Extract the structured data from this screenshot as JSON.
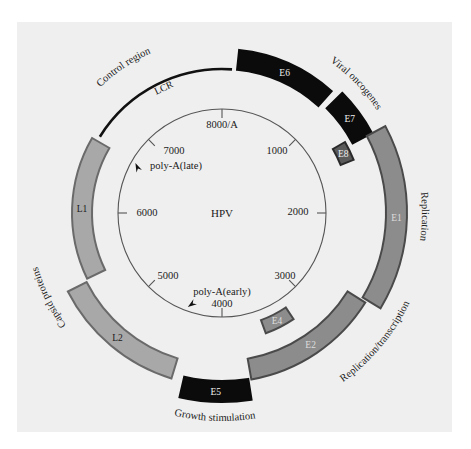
{
  "diagram": {
    "title": "HPV",
    "center": {
      "x": 222,
      "y": 213
    },
    "colors": {
      "background": "#ffffff",
      "panel": "#efefef",
      "black_gene": "#0b0b0b",
      "light_gene_fill": "#a8a8a8",
      "light_gene_edge": "#6a6a6a",
      "mid_gene_fill": "#8c8c8c",
      "mid_gene_edge": "#4a4a4a",
      "ring": "#555555",
      "text": "#1a1a1a",
      "label_on_dark": "#f0f0f0"
    },
    "genome_ring": {
      "radius": 104,
      "ticks": [
        {
          "label": "8000/A",
          "angle": 0
        },
        {
          "label": "1000",
          "angle": 45
        },
        {
          "label": "2000",
          "angle": 90
        },
        {
          "label": "3000",
          "angle": 135
        },
        {
          "label": "4000",
          "angle": 180
        },
        {
          "label": "5000",
          "angle": 225
        },
        {
          "label": "6000",
          "angle": 270
        },
        {
          "label": "7000",
          "angle": 315
        }
      ],
      "poly_a": [
        {
          "label": "poly-A(late)",
          "angle": 300
        },
        {
          "label": "poly-A(early)",
          "angle": 200
        }
      ]
    },
    "lcr": {
      "label": "LCR",
      "r": 144,
      "start": 302,
      "end": 4
    },
    "genes": [
      {
        "name": "E6",
        "start": 6,
        "end": 42,
        "r_in": 144,
        "r_out": 164,
        "style": "black"
      },
      {
        "name": "E7",
        "start": 45,
        "end": 62,
        "r_in": 148,
        "r_out": 170,
        "style": "black"
      },
      {
        "name": "E8",
        "start": 60,
        "end": 68,
        "r_in": 128,
        "r_out": 142,
        "style": "dark"
      },
      {
        "name": "E1",
        "start": 62,
        "end": 121,
        "r_in": 164,
        "r_out": 185,
        "style": "mid"
      },
      {
        "name": "E2",
        "start": 122,
        "end": 170,
        "r_in": 148,
        "r_out": 169,
        "style": "mid"
      },
      {
        "name": "E4",
        "start": 146,
        "end": 160,
        "r_in": 114,
        "r_out": 128,
        "style": "mid"
      },
      {
        "name": "E5",
        "start": 171,
        "end": 193,
        "r_in": 168,
        "r_out": 189,
        "style": "black"
      },
      {
        "name": "L2",
        "start": 197,
        "end": 243,
        "r_in": 152,
        "r_out": 173,
        "style": "light"
      },
      {
        "name": "L1",
        "start": 244,
        "end": 300,
        "r_in": 130,
        "r_out": 150,
        "style": "light"
      }
    ],
    "group_labels": [
      {
        "text": "Control region",
        "angle": 326,
        "r": 175
      },
      {
        "text": "Viral oncogenes",
        "angle": 46,
        "r": 186
      },
      {
        "text": "Replication",
        "angle": 91,
        "r": 200
      },
      {
        "text": "Replication/transcription",
        "angle": 130,
        "r": 200
      },
      {
        "text": "Growth stimulation",
        "angle": 182,
        "r": 200
      },
      {
        "text": "Capsid proteins",
        "angle": 244,
        "r": 192
      }
    ]
  }
}
